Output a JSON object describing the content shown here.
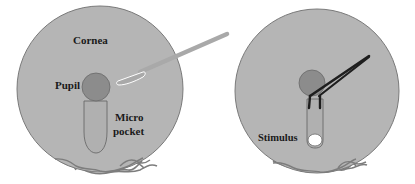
{
  "figure": {
    "panels": [
      {
        "id": "left",
        "labels": {
          "cornea": "Cornea",
          "pupil": "Pupil",
          "pocket_line1": "Micro",
          "pocket_line2": "pocket"
        },
        "elements": [
          "cornea-disc",
          "pupil",
          "micropocket",
          "surgical-knife",
          "limbal-vessels"
        ]
      },
      {
        "id": "right",
        "labels": {
          "stimulus": "Stimulus"
        },
        "elements": [
          "cornea-disc",
          "pupil",
          "micropocket",
          "forceps",
          "stimulus-pellet",
          "limbal-vessels"
        ]
      }
    ],
    "colors": {
      "cornea_fill": "#b5b5b5",
      "cornea_edge": "#7a7a7a",
      "pupil_fill": "#8c8c8c",
      "pocket_line": "#6a6a6a",
      "knife": "#a9a9a9",
      "forceps": "#1e1e1e",
      "stimulus": "#ffffff",
      "vessels": "#7d7d7d"
    }
  }
}
